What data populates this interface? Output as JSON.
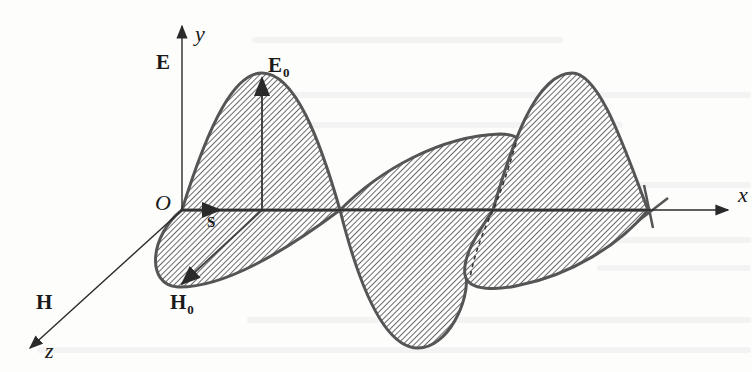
{
  "figure": {
    "type": "electromagnetic-plane-wave-diagram",
    "axes": {
      "x_label": "x",
      "y_label": "y",
      "z_label": "z",
      "origin_label": "O"
    },
    "field_labels": {
      "electric_field": "E",
      "electric_amplitude": "E",
      "electric_amplitude_sub": "0",
      "magnetic_field": "H",
      "magnetic_amplitude": "H",
      "magnetic_amplitude_sub": "0",
      "poynting_vector": "S"
    },
    "colors": {
      "curve_stroke": "#555555",
      "hatch": "#6a6a6a",
      "axis": "#2a2a2a",
      "background": "#fdfdfc",
      "bleed_text": "#e6e6e6"
    }
  }
}
